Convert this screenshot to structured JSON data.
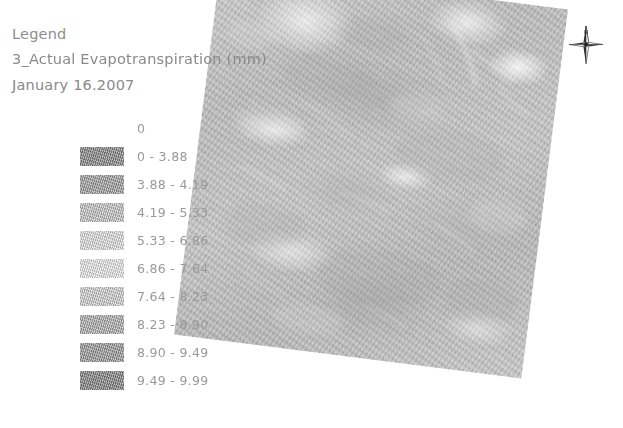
{
  "legend": {
    "heading": "Legend",
    "title": "3_Actual Evapotranspiration (mm)",
    "date": "January 16.2007",
    "items": [
      {
        "label": "0",
        "color": "#ffffff"
      },
      {
        "label": "0 - 3.88",
        "color": "#8f8f8f"
      },
      {
        "label": "3.88 - 4.19",
        "color": "#a9a9a9"
      },
      {
        "label": "4.19 - 5.33",
        "color": "#cfcfcf"
      },
      {
        "label": "5.33 - 6.86",
        "color": "#ececec"
      },
      {
        "label": "6.86 - 7.64",
        "color": "#f6f6f6"
      },
      {
        "label": "7.64 - 8.23",
        "color": "#dcdcdc"
      },
      {
        "label": "8.23 - 8.90",
        "color": "#b8b8b8"
      },
      {
        "label": "8.90 - 9.49",
        "color": "#a3a3a3"
      },
      {
        "label": "9.49 - 9.99",
        "color": "#8b8b8b"
      }
    ]
  },
  "map": {
    "name": "evapotranspiration-raster",
    "base_color": "#b9b9b9",
    "rotation_deg": 7.2
  },
  "north_arrow": {
    "name": "north-arrow",
    "label": "N"
  },
  "chart_data": {
    "type": "map",
    "title": "3_Actual Evapotranspiration (mm)",
    "subtitle": "January 16.2007",
    "legend_title": "Legend",
    "units": "mm",
    "classification": "graduated-classes",
    "class_count": 10,
    "value_min": 0,
    "value_max": 9.99,
    "class_breaks": [
      0,
      3.88,
      4.19,
      5.33,
      6.86,
      7.64,
      8.23,
      8.9,
      9.49,
      9.99
    ],
    "categories": [
      "0",
      "0 - 3.88",
      "3.88 - 4.19",
      "4.19 - 5.33",
      "5.33 - 6.86",
      "6.86 - 7.64",
      "7.64 - 8.23",
      "8.23 - 8.90",
      "8.90 - 9.49",
      "9.49 - 9.99"
    ],
    "colors": [
      "#ffffff",
      "#8f8f8f",
      "#a9a9a9",
      "#cfcfcf",
      "#ececec",
      "#f6f6f6",
      "#dcdcdc",
      "#b8b8b8",
      "#a3a3a3",
      "#8b8b8b"
    ],
    "legend_position": "left",
    "grid": false,
    "colormap": "grayscale",
    "annotations": [
      "N"
    ]
  }
}
